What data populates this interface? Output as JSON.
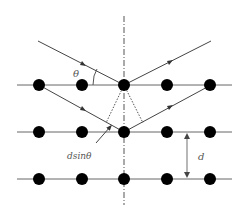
{
  "diagram": {
    "labels": {
      "theta": "θ",
      "path_difference": "dsinθ",
      "spacing": "d"
    },
    "rows_y": [
      85,
      132,
      179
    ],
    "atoms_x": [
      39,
      82,
      124,
      167,
      210
    ],
    "colors": {
      "line": "#555555",
      "atom": "#000000",
      "background": "#ffffff"
    }
  }
}
